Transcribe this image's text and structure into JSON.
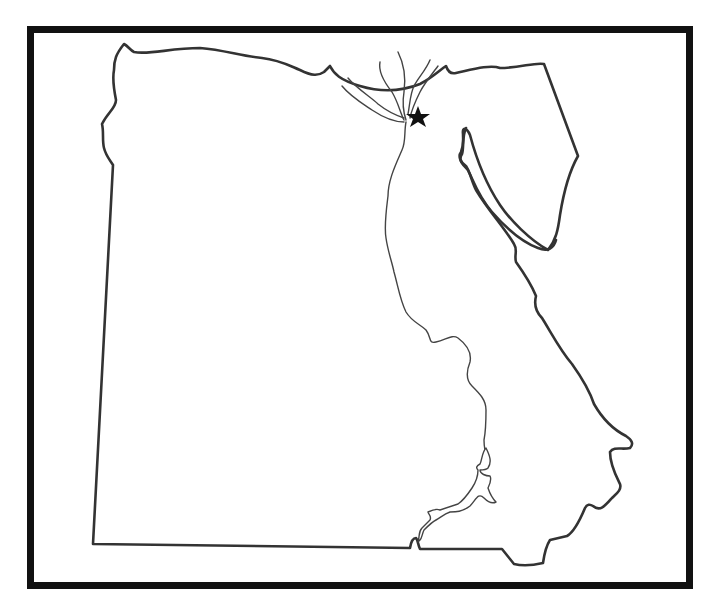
{
  "map": {
    "region": "Egypt",
    "style": "blank outline map",
    "frame_color": "#111111",
    "outline_color": "#333333",
    "river_color": "#444444",
    "background_color": "#ffffff",
    "features": {
      "country_border": "Egypt outline",
      "peninsula": "Sinai Peninsula",
      "river": "Nile River",
      "delta": "Nile Delta",
      "lake": "Lake Nasser"
    },
    "marker": {
      "symbol": "★",
      "icon": "star-icon",
      "color": "#111111",
      "position": "east of Nile Delta apex"
    }
  }
}
